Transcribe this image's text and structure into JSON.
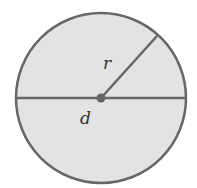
{
  "diagram": {
    "labels": {
      "radius": "r",
      "diameter": "d"
    },
    "colors": {
      "fill": "#e3e3e3",
      "stroke": "#666666",
      "center": "#666666"
    },
    "geometry": {
      "center": [
        101,
        98
      ],
      "radius": 85,
      "radius_endpoint": [
        157,
        36
      ]
    }
  }
}
